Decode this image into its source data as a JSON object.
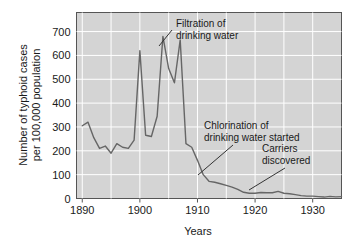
{
  "chart_data": {
    "type": "line",
    "title": "",
    "xlabel": "Years",
    "ylabel": "Number of typhoid cases\nper 100,000 population",
    "ylabel_line1": "Number of typhoid cases",
    "ylabel_line2": "per 100,000 population",
    "xlim": [
      1889,
      1935
    ],
    "ylim": [
      0,
      780
    ],
    "xticks": [
      1890,
      1900,
      1910,
      1920,
      1930
    ],
    "xtick_labels": [
      "1890",
      "1900",
      "1910",
      "1920",
      "1930"
    ],
    "yticks": [
      0,
      100,
      200,
      300,
      400,
      500,
      600,
      700
    ],
    "ytick_labels": [
      "0",
      "100",
      "200",
      "300",
      "400",
      "500",
      "600",
      "700"
    ],
    "grid": true,
    "grid_color": "#ffffff",
    "plot_background": "#d4d4d4",
    "line_color": "#666666",
    "series_name": "Typhoid cases per 100,000",
    "x": [
      1890,
      1891,
      1892,
      1893,
      1894,
      1895,
      1896,
      1897,
      1898,
      1899,
      1900,
      1901,
      1902,
      1903,
      1904,
      1905,
      1906,
      1907,
      1908,
      1909,
      1910,
      1911,
      1912,
      1913,
      1914,
      1915,
      1916,
      1917,
      1918,
      1919,
      1920,
      1921,
      1922,
      1923,
      1924,
      1925,
      1926,
      1927,
      1928,
      1929,
      1930,
      1931,
      1932,
      1933,
      1934,
      1935
    ],
    "values": [
      305,
      320,
      255,
      210,
      220,
      190,
      230,
      215,
      210,
      245,
      620,
      265,
      260,
      345,
      680,
      545,
      485,
      665,
      230,
      215,
      160,
      100,
      72,
      68,
      62,
      55,
      48,
      38,
      26,
      22,
      22,
      25,
      24,
      24,
      30,
      22,
      20,
      16,
      12,
      10,
      10,
      8,
      6,
      9,
      7,
      8
    ],
    "annotations": [
      {
        "id": "filtration",
        "line1": "Filtration of",
        "line2": "drinking water",
        "points_to_year": 1906,
        "points_to_value": 665
      },
      {
        "id": "chlorination",
        "line1": "Chlorination of",
        "line2": "drinking water started",
        "points_to_year": 1912,
        "points_to_value": 72
      },
      {
        "id": "carriers",
        "line1": "Carriers",
        "line2": "discovered",
        "points_to_year": 1922,
        "points_to_value": 24
      }
    ]
  }
}
